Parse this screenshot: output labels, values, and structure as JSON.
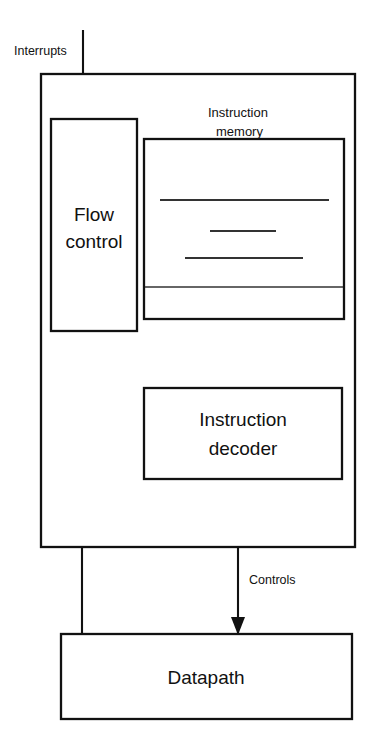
{
  "diagram": {
    "background_color": "#ffffff",
    "line_color": "#111111",
    "blocks": [
      {
        "id": "control_unit",
        "label": "",
        "x": 41,
        "y": 74,
        "w": 314,
        "h": 473,
        "stroke": 2.2
      },
      {
        "id": "flow_control",
        "label": "Flow\ncontrol",
        "line1": "Flow",
        "line2": "control",
        "x": 51,
        "y": 119,
        "w": 86,
        "h": 212,
        "stroke": 2.2
      },
      {
        "id": "instruction_memory",
        "label": "",
        "x": 144,
        "y": 139,
        "w": 200,
        "h": 180,
        "stroke": 2.2
      },
      {
        "id": "instruction_decoder",
        "label": "Instruction\ndecoder",
        "line1": "Instruction",
        "line2": "decoder",
        "x": 144,
        "y": 388,
        "w": 198,
        "h": 91,
        "stroke": 2.2
      },
      {
        "id": "datapath",
        "label": "Datapath",
        "line1": "Datapath",
        "x": 61,
        "y": 634,
        "w": 291,
        "h": 85,
        "stroke": 2.2
      }
    ],
    "labels": {
      "interrupts": "Interrupts",
      "address": "Address",
      "instruction_memory": {
        "line1": "Instruction",
        "line2": "memory"
      },
      "flow_control": {
        "line1": "Flow",
        "line2": "control"
      },
      "instruction": "Instruction",
      "instruction_decoder": {
        "line1": "Instruction",
        "line2": "decoder"
      },
      "status": "Status",
      "controls": "Controls",
      "datapath": "Datapath"
    },
    "memory_rows": [
      {
        "id": "mem-row-1",
        "x1": 160,
        "x2": 329,
        "y": 200
      },
      {
        "id": "mem-row-2",
        "x1": 210,
        "x2": 276,
        "y": 231
      },
      {
        "id": "mem-row-3",
        "x1": 185,
        "x2": 303,
        "y": 258
      },
      {
        "id": "mem-divider",
        "x1": 145,
        "x2": 343,
        "y": 287
      }
    ],
    "signals": [
      {
        "id": "interrupts",
        "label": "Interrupts",
        "from": "external",
        "to": "flow_control",
        "direction": "down"
      },
      {
        "id": "address",
        "label": "Address",
        "from": "flow_control",
        "to": "instruction_memory",
        "direction": "down"
      },
      {
        "id": "instruction",
        "label": "Instruction",
        "from": "instruction_memory",
        "to": "instruction_decoder",
        "direction": "down"
      },
      {
        "id": "controls",
        "label": "Controls",
        "from": "instruction_decoder",
        "to": "datapath",
        "direction": "down"
      },
      {
        "id": "status",
        "label": "Status",
        "from": "datapath",
        "to": "flow_control",
        "direction": "up"
      }
    ]
  }
}
